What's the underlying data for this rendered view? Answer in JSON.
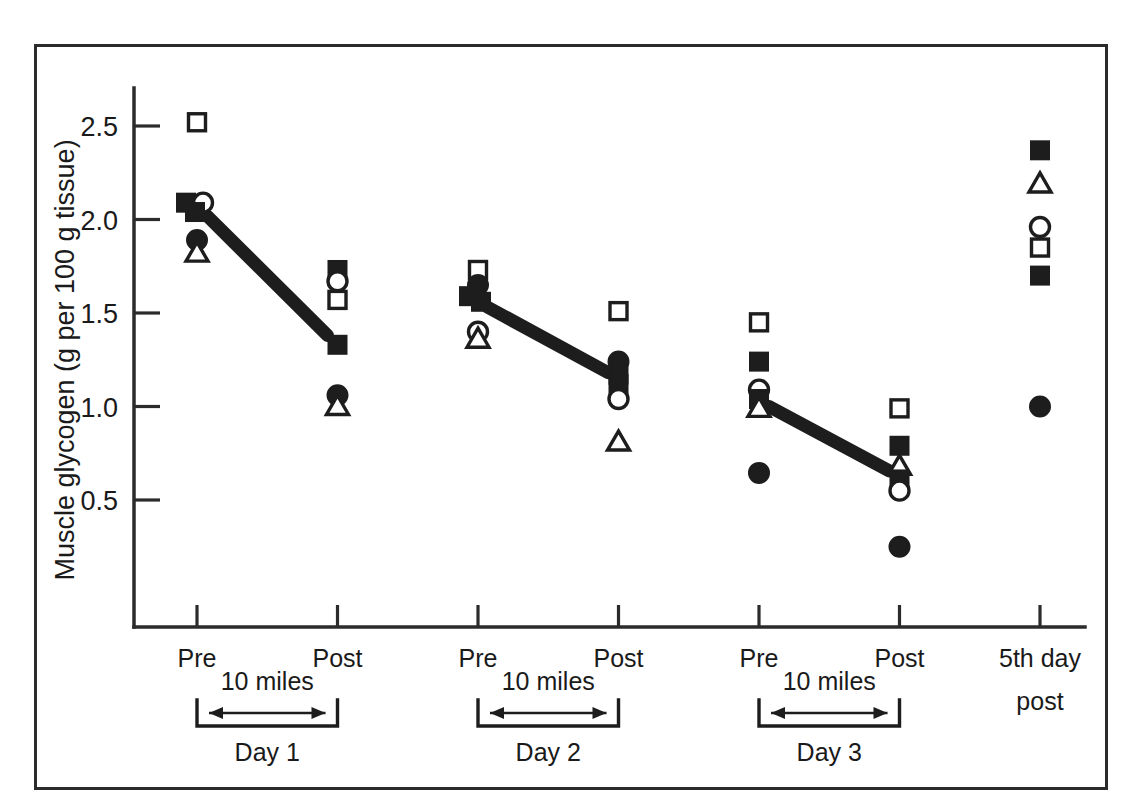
{
  "figure": {
    "background_color": "#ffffff",
    "frame_color": "#2b2b2b",
    "ink_color": "#1d1d1d"
  },
  "axis": {
    "y_title": "Muscle glycogen (g per 100 g tissue)",
    "y_ticks": [
      "0.5",
      "1.0",
      "1.5",
      "2.0",
      "2.5"
    ],
    "x_ticks": [
      "Pre",
      "Post",
      "Pre",
      "Post",
      "Pre",
      "Post",
      "5th day"
    ],
    "x_tick_last_second_line": "post"
  },
  "brackets": [
    {
      "label": "10 miles",
      "day": "Day 1"
    },
    {
      "label": "10 miles",
      "day": "Day 2"
    },
    {
      "label": "10 miles",
      "day": "Day 3"
    }
  ],
  "chart_data": {
    "type": "scatter",
    "title": "",
    "xlabel": "",
    "ylabel": "Muscle glycogen (g per 100 g tissue)",
    "ylim": [
      0.0,
      2.75
    ],
    "yticks": [
      0.5,
      1.0,
      1.5,
      2.0,
      2.5
    ],
    "grid": false,
    "legend": "none",
    "categories": [
      "Pre",
      "Post",
      "Pre",
      "Post",
      "Pre",
      "Post",
      "5th day post"
    ],
    "category_groups": [
      "Day 1",
      "Day 1",
      "Day 2",
      "Day 2",
      "Day 3",
      "Day 3",
      "5th day post"
    ],
    "marker_types": [
      "open-square",
      "filled-square",
      "open-circle",
      "filled-circle",
      "open-triangle"
    ],
    "points": [
      {
        "x_index": 0,
        "value": 2.52,
        "marker": "open-square"
      },
      {
        "x_index": 0,
        "value": 2.09,
        "marker": "filled-square"
      },
      {
        "x_index": 0,
        "value": 2.09,
        "marker": "open-circle"
      },
      {
        "x_index": 0,
        "value": 2.04,
        "marker": "filled-square"
      },
      {
        "x_index": 0,
        "value": 1.89,
        "marker": "filled-circle"
      },
      {
        "x_index": 0,
        "value": 1.82,
        "marker": "open-triangle"
      },
      {
        "x_index": 1,
        "value": 1.73,
        "marker": "filled-square"
      },
      {
        "x_index": 1,
        "value": 1.67,
        "marker": "open-circle"
      },
      {
        "x_index": 1,
        "value": 1.57,
        "marker": "open-square"
      },
      {
        "x_index": 1,
        "value": 1.33,
        "marker": "filled-square"
      },
      {
        "x_index": 1,
        "value": 1.06,
        "marker": "filled-circle"
      },
      {
        "x_index": 1,
        "value": 1.0,
        "marker": "open-triangle"
      },
      {
        "x_index": 2,
        "value": 1.73,
        "marker": "open-square"
      },
      {
        "x_index": 2,
        "value": 1.65,
        "marker": "filled-circle"
      },
      {
        "x_index": 2,
        "value": 1.59,
        "marker": "filled-square"
      },
      {
        "x_index": 2,
        "value": 1.56,
        "marker": "filled-square"
      },
      {
        "x_index": 2,
        "value": 1.4,
        "marker": "open-circle"
      },
      {
        "x_index": 2,
        "value": 1.36,
        "marker": "open-triangle"
      },
      {
        "x_index": 3,
        "value": 1.51,
        "marker": "open-square"
      },
      {
        "x_index": 3,
        "value": 1.24,
        "marker": "filled-circle"
      },
      {
        "x_index": 3,
        "value": 1.17,
        "marker": "filled-square"
      },
      {
        "x_index": 3,
        "value": 1.12,
        "marker": "filled-square"
      },
      {
        "x_index": 3,
        "value": 1.04,
        "marker": "open-circle"
      },
      {
        "x_index": 3,
        "value": 0.81,
        "marker": "open-triangle"
      },
      {
        "x_index": 4,
        "value": 1.45,
        "marker": "open-square"
      },
      {
        "x_index": 4,
        "value": 1.24,
        "marker": "filled-square"
      },
      {
        "x_index": 4,
        "value": 1.09,
        "marker": "open-circle"
      },
      {
        "x_index": 4,
        "value": 1.04,
        "marker": "filled-square"
      },
      {
        "x_index": 4,
        "value": 0.99,
        "marker": "open-triangle"
      },
      {
        "x_index": 4,
        "value": 0.645,
        "marker": "filled-circle"
      },
      {
        "x_index": 5,
        "value": 0.99,
        "marker": "open-square"
      },
      {
        "x_index": 5,
        "value": 0.79,
        "marker": "filled-square"
      },
      {
        "x_index": 5,
        "value": 0.68,
        "marker": "open-triangle"
      },
      {
        "x_index": 5,
        "value": 0.61,
        "marker": "filled-square"
      },
      {
        "x_index": 5,
        "value": 0.55,
        "marker": "open-circle"
      },
      {
        "x_index": 5,
        "value": 0.25,
        "marker": "filled-circle"
      },
      {
        "x_index": 6,
        "value": 2.37,
        "marker": "filled-square"
      },
      {
        "x_index": 6,
        "value": 2.19,
        "marker": "open-triangle"
      },
      {
        "x_index": 6,
        "value": 1.96,
        "marker": "open-circle"
      },
      {
        "x_index": 6,
        "value": 1.85,
        "marker": "open-square"
      },
      {
        "x_index": 6,
        "value": 1.7,
        "marker": "filled-square"
      },
      {
        "x_index": 6,
        "value": 1.0,
        "marker": "filled-circle"
      }
    ],
    "trend_lines": [
      {
        "group": "Day 1",
        "from_x_index": 0,
        "from_value": 2.02,
        "to_x_index": 1,
        "to_value": 1.38
      },
      {
        "group": "Day 2",
        "from_x_index": 2,
        "from_value": 1.53,
        "to_x_index": 3,
        "to_value": 1.18
      },
      {
        "group": "Day 3",
        "from_x_index": 4,
        "from_value": 1.0,
        "to_x_index": 5,
        "to_value": 0.655
      }
    ]
  }
}
